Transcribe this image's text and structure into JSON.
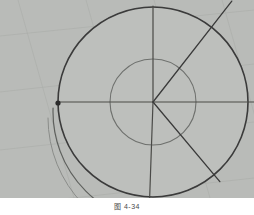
{
  "figure": {
    "caption": "图 4-34",
    "canvas": {
      "width": 254,
      "height": 198,
      "background_color": "#b9bbb8",
      "grid_color": "#acaeab",
      "fill_color": "#bdbfbc"
    },
    "ink": {
      "primary_stroke_color": "#3a3a3a",
      "secondary_stroke_color": "#6e706d",
      "faint_stroke_color": "#8a8c89",
      "point_marker_color": "#2b2b2b"
    }
  },
  "chart_data": {
    "type": "diagram",
    "title": "图 4-34",
    "subtitle": "",
    "coordinate_space": {
      "width": 254,
      "height": 198,
      "origin": "top-left",
      "units": "pixels"
    },
    "center": {
      "label": "O",
      "x": 153,
      "y": 102
    },
    "circles": [
      {
        "name": "outer-circle",
        "cx": 153,
        "cy": 102,
        "r": 95,
        "stroke": "#3a3a3a",
        "stroke_width": 1.6,
        "fill": "none"
      },
      {
        "name": "inner-circle",
        "cx": 153,
        "cy": 102,
        "r": 43,
        "stroke": "#6e706d",
        "stroke_width": 1.1,
        "fill": "none"
      }
    ],
    "arcs": [
      {
        "name": "outer-sweep-arc",
        "cx": 165,
        "cy": 112,
        "r": 112,
        "start_angle_deg": 178,
        "end_angle_deg": 272,
        "stroke": "#5e605d",
        "stroke_width": 1.2
      },
      {
        "name": "secondary-sweep-arc",
        "cx": 172,
        "cy": 118,
        "r": 124,
        "start_angle_deg": 180,
        "end_angle_deg": 268,
        "stroke": "#8a8c89",
        "stroke_width": 1.0
      }
    ],
    "spokes": [
      {
        "name": "spoke-east",
        "angle_deg": 0,
        "inner_r": 0,
        "outer_r": 112,
        "stroke": "#4a4a47",
        "stroke_width": 1.2
      },
      {
        "name": "spoke-northeast",
        "angle_deg": 52,
        "inner_r": 0,
        "outer_r": 128,
        "stroke": "#3a3a3a",
        "stroke_width": 1.3
      },
      {
        "name": "spoke-north",
        "angle_deg": 90,
        "inner_r": 0,
        "outer_r": 96,
        "stroke": "#4a4a47",
        "stroke_width": 1.2
      },
      {
        "name": "spoke-west",
        "angle_deg": 180,
        "inner_r": 0,
        "outer_r": 96,
        "stroke": "#4a4a47",
        "stroke_width": 1.2
      },
      {
        "name": "spoke-south",
        "angle_deg": 268,
        "inner_r": 0,
        "outer_r": 108,
        "stroke": "#4a4a47",
        "stroke_width": 1.2
      },
      {
        "name": "spoke-southeast",
        "angle_deg": 310,
        "inner_r": 0,
        "outer_r": 104,
        "stroke": "#3a3a3a",
        "stroke_width": 1.3
      }
    ],
    "points": [
      {
        "name": "left-tangent-point",
        "label": "",
        "x": 58,
        "y": 103,
        "r": 2.6,
        "color": "#2b2b2b"
      }
    ],
    "grid": {
      "enabled": true,
      "style": "faint-diagonal",
      "color": "#acaeab",
      "lines": [
        {
          "x1": 0,
          "y1": 36,
          "x2": 254,
          "y2": 10
        },
        {
          "x1": 0,
          "y1": 92,
          "x2": 254,
          "y2": 64
        },
        {
          "x1": 0,
          "y1": 150,
          "x2": 254,
          "y2": 122
        },
        {
          "x1": 0,
          "y1": 206,
          "x2": 254,
          "y2": 178
        },
        {
          "x1": 18,
          "y1": 0,
          "x2": 74,
          "y2": 198
        },
        {
          "x1": 86,
          "y1": 0,
          "x2": 142,
          "y2": 198
        },
        {
          "x1": 154,
          "y1": 0,
          "x2": 210,
          "y2": 198
        },
        {
          "x1": 222,
          "y1": 0,
          "x2": 278,
          "y2": 198
        }
      ]
    },
    "legend": {
      "visible": false,
      "entries": []
    },
    "axes": {
      "visible": false
    }
  }
}
